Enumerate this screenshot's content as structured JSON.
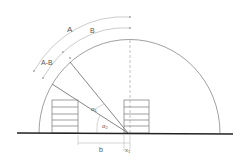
{
  "diagram": {
    "labels": {
      "arc_outer": "A",
      "arc_inner": "B",
      "arc_diff": "A-B",
      "angle_1": "α",
      "angle_1_sub": "1",
      "angle_2": "α",
      "angle_2_sub": "2",
      "dim_b": "b",
      "dim_x": "x",
      "dim_x_sub": "1"
    },
    "colors": {
      "ground": "#222222",
      "lines": "#666666",
      "light": "#aaaaaa"
    }
  }
}
